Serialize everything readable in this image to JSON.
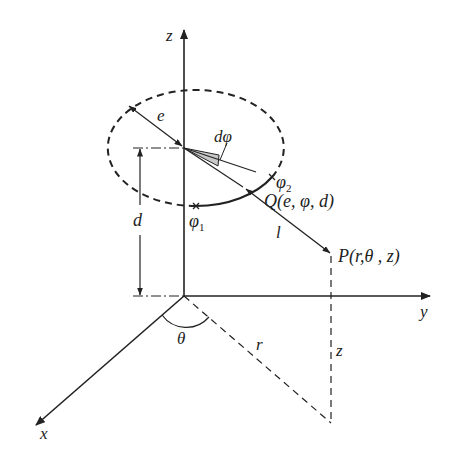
{
  "diagram": {
    "axes": {
      "z_label": "z",
      "y_label": "y",
      "x_label": "x"
    },
    "labels": {
      "radius": "e",
      "dphi": "dφ",
      "phi1": "φ",
      "phi1_sub": "1",
      "phi2": "φ",
      "phi2_sub": "2",
      "Q": "Q(e, φ, d)",
      "l": "l",
      "P": "P(r,θ , z)",
      "d": "d",
      "theta": "θ",
      "r": "r",
      "z_height": "z"
    },
    "colors": {
      "line": "#222222",
      "wedge_fill": "#c8c8c8",
      "background": "#ffffff"
    }
  }
}
